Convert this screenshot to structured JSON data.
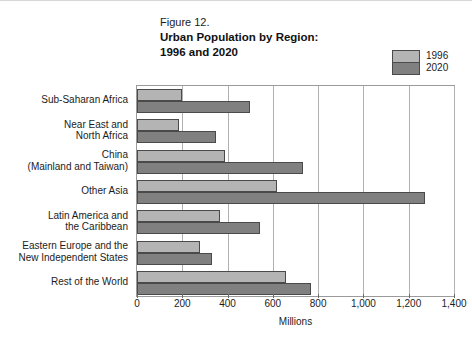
{
  "figure": {
    "number": "Figure 12.",
    "title_line1": "Urban Population by Region:",
    "title_line2": "1996 and 2020"
  },
  "legend": {
    "entries": [
      {
        "label": "1996",
        "color": "#b4b4b4"
      },
      {
        "label": "2020",
        "color": "#808080"
      }
    ]
  },
  "chart_data": {
    "type": "bar",
    "orientation": "horizontal",
    "title": "Urban Population by Region: 1996 and 2020",
    "xlabel": "Millions",
    "ylabel": "",
    "xlim": [
      0,
      1400
    ],
    "xticks": [
      0,
      200,
      400,
      600,
      800,
      1000,
      1200,
      1400
    ],
    "xtick_labels": [
      "0",
      "200",
      "400",
      "600",
      "800",
      "1,000",
      "1,200",
      "1,400"
    ],
    "grid": true,
    "legend_position": "top-right",
    "categories": [
      "Sub-Saharan Africa",
      "Near East and\nNorth Africa",
      "China\n(Mainland and Taiwan)",
      "Other Asia",
      "Latin America and\nthe Caribbean",
      "Eastern Europe and the\nNew Independent States",
      "Rest of the World"
    ],
    "series": [
      {
        "name": "1996",
        "color": "#b4b4b4",
        "values": [
          200,
          185,
          390,
          620,
          365,
          280,
          660
        ]
      },
      {
        "name": "2020",
        "color": "#808080",
        "values": [
          500,
          350,
          735,
          1270,
          545,
          330,
          770
        ]
      }
    ]
  }
}
